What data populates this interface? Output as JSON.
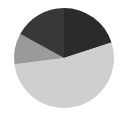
{
  "chart_data": {
    "type": "pie",
    "title": "",
    "labels": [
      "Slice 1",
      "Slice 2",
      "Slice 3",
      "Slice 4"
    ],
    "values": [
      20,
      53,
      10,
      17
    ],
    "colors": [
      "#2b2b2b",
      "#cfcfcf",
      "#9a9a9a",
      "#383838"
    ],
    "start_angle": "12 o'clock",
    "direction": "clockwise",
    "legend": "none"
  }
}
